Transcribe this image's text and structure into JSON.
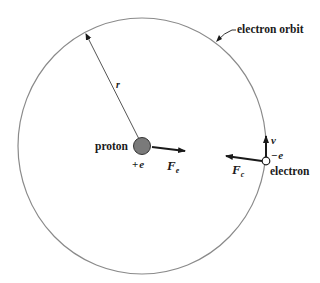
{
  "diagram": {
    "orbit_label": "electron orbit",
    "radius_label": "r",
    "proton": {
      "label": "proton",
      "charge": "+e",
      "force_label": "F",
      "force_subscript": "e"
    },
    "electron": {
      "label": "electron",
      "charge": "−e",
      "velocity_label": "v",
      "force_label": "F",
      "force_subscript": "c"
    },
    "colors": {
      "orbit": "#8a8a8a",
      "proton_fill": "#7a7a7a",
      "ink": "#1a1a1a",
      "background": "#ffffff"
    }
  }
}
